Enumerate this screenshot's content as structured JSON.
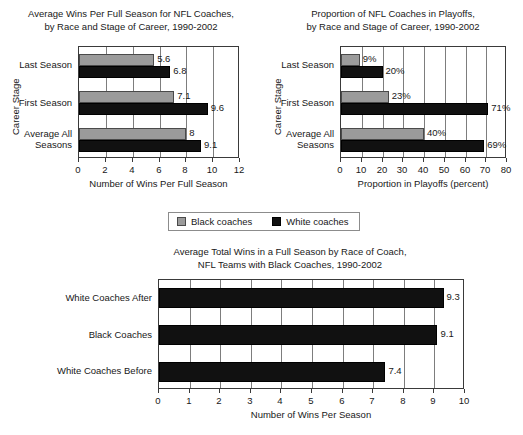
{
  "legend": {
    "entries": [
      {
        "label": "Black coaches",
        "swatch": "gray-swatch-icon",
        "color": "#9b9b9b"
      },
      {
        "label": "White coaches",
        "swatch": "black-swatch-icon",
        "color": "#111111"
      }
    ]
  },
  "chart_data": [
    {
      "id": "wins-per-full-season",
      "type": "bar",
      "orientation": "horizontal",
      "title": "Average Wins Per Full Season for NFL Coaches,\nby Race and Stage of Career, 1990-2002",
      "xlabel": "Number of Wins Per Full Season",
      "ylabel": "Career Stage",
      "categories": [
        "Last Season",
        "First Season",
        "Average All\nSeasons"
      ],
      "series": [
        {
          "name": "Black coaches",
          "color": "#9b9b9b",
          "values": [
            5.6,
            7.1,
            8
          ],
          "labels": [
            "5.6",
            "7.1",
            "8"
          ]
        },
        {
          "name": "White coaches",
          "color": "#111111",
          "values": [
            6.8,
            9.6,
            9.1
          ],
          "labels": [
            "6.8",
            "9.6",
            "9.1"
          ]
        }
      ],
      "xlim": [
        0,
        12
      ],
      "xticks": [
        0,
        2,
        4,
        6,
        8,
        10,
        12
      ],
      "xticklabels": [
        "0",
        "2",
        "4",
        "6",
        "8",
        "10",
        "12"
      ],
      "grid": true,
      "legend_position": "below"
    },
    {
      "id": "proportion-in-playoffs",
      "type": "bar",
      "orientation": "horizontal",
      "title": "Proportion of NFL Coaches in Playoffs,\nby Race and Stage of Career, 1990-2002",
      "xlabel": "Proportion in Playoffs (percent)",
      "ylabel": "Career Stage",
      "categories": [
        "Last Season",
        "First Season",
        "Average All\nSeasons"
      ],
      "series": [
        {
          "name": "Black coaches",
          "color": "#9b9b9b",
          "values": [
            9,
            23,
            40
          ],
          "labels": [
            "9%",
            "23%",
            "40%"
          ]
        },
        {
          "name": "White coaches",
          "color": "#111111",
          "values": [
            20,
            71,
            69
          ],
          "labels": [
            "20%",
            "71%",
            "69%"
          ]
        }
      ],
      "xlim": [
        0,
        80
      ],
      "xticks": [
        0,
        10,
        20,
        30,
        40,
        50,
        60,
        70,
        80
      ],
      "xticklabels": [
        "0",
        "10",
        "20",
        "30",
        "40",
        "50",
        "60",
        "70",
        "80"
      ],
      "grid": true,
      "legend_position": "below"
    },
    {
      "id": "total-wins-black-coach-teams",
      "type": "bar",
      "orientation": "horizontal",
      "title": "Average Total Wins in a Full Season by Race of Coach,\nNFL Teams with Black Coaches, 1990-2002",
      "xlabel": "Number of Wins Per Season",
      "ylabel": "",
      "categories": [
        "White Coaches After",
        "Black Coaches",
        "White Coaches Before"
      ],
      "series": [
        {
          "name": "Wins",
          "color": "#111111",
          "values": [
            9.3,
            9.1,
            7.4
          ],
          "labels": [
            "9.3",
            "9.1",
            "7.4"
          ]
        }
      ],
      "xlim": [
        0,
        10
      ],
      "xticks": [
        0,
        1,
        2,
        3,
        4,
        5,
        6,
        7,
        8,
        9,
        10
      ],
      "xticklabels": [
        "0",
        "1",
        "2",
        "3",
        "4",
        "5",
        "6",
        "7",
        "8",
        "9",
        "10"
      ],
      "grid": true,
      "legend_position": "none"
    }
  ]
}
